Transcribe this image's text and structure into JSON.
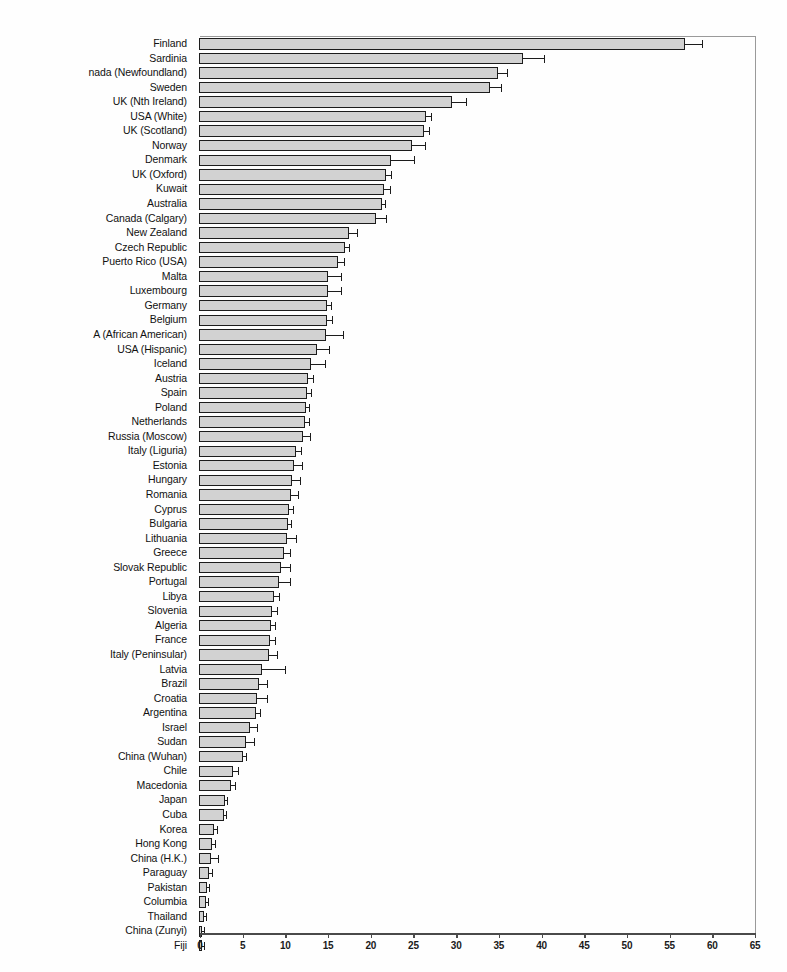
{
  "chart_data": {
    "type": "bar",
    "orientation": "horizontal",
    "title": "",
    "subtitle": "",
    "xlabel": "",
    "ylabel": "",
    "xlim": [
      0,
      65
    ],
    "xticks": [
      0,
      5,
      10,
      15,
      20,
      25,
      30,
      35,
      40,
      45,
      50,
      55,
      60,
      65
    ],
    "xtick_labels": [
      "0",
      "5",
      "10",
      "15",
      "20",
      "25",
      "30",
      "35",
      "40",
      "45",
      "50",
      "55",
      "60",
      "65"
    ],
    "grid": false,
    "legend": null,
    "error_bars": "upper only",
    "bar_fill_color": "#d2d2d2",
    "bar_edge_color": "#1c1c1c",
    "categories": [
      "Finland",
      "Sardinia",
      "nada (Newfoundland)",
      "Sweden",
      "UK (Nth Ireland)",
      "USA (White)",
      "UK (Scotland)",
      "Norway",
      "Denmark",
      "UK (Oxford)",
      "Kuwait",
      "Australia",
      "Canada (Calgary)",
      "New Zealand",
      "Czech Republic",
      "Puerto Rico (USA)",
      "Malta",
      "Luxembourg",
      "Germany",
      "Belgium",
      "A (African American)",
      "USA (Hispanic)",
      "Iceland",
      "Austria",
      "Spain",
      "Poland",
      "Netherlands",
      "Russia (Moscow)",
      "Italy (Liguria)",
      "Estonia",
      "Hungary",
      "Romania",
      "Cyprus",
      "Bulgaria",
      "Lithuania",
      "Greece",
      "Slovak Republic",
      "Portugal",
      "Libya",
      "Slovenia",
      "Algeria",
      "France",
      "Italy (Peninsular)",
      "Latvia",
      "Brazil",
      "Croatia",
      "Argentina",
      "Israel",
      "Sudan",
      "China (Wuhan)",
      "Chile",
      "Macedonia",
      "Japan",
      "Cuba",
      "Korea",
      "Hong Kong",
      "China (H.K.)",
      "Paraguay",
      "Pakistan",
      "Columbia",
      "Thailand",
      "China (Zunyi)",
      "Fiji"
    ],
    "values": [
      56.8,
      37.8,
      34.9,
      34.0,
      29.5,
      26.5,
      26.2,
      24.8,
      22.4,
      21.8,
      21.6,
      21.3,
      20.6,
      17.5,
      17.0,
      16.2,
      15.0,
      15.0,
      14.9,
      14.9,
      14.8,
      13.7,
      13.0,
      12.7,
      12.5,
      12.4,
      12.3,
      12.1,
      11.2,
      11.0,
      10.8,
      10.7,
      10.4,
      10.3,
      10.2,
      9.8,
      9.5,
      9.2,
      8.7,
      8.4,
      8.3,
      8.2,
      8.1,
      7.3,
      6.9,
      6.7,
      6.5,
      5.9,
      5.4,
      5.0,
      3.9,
      3.6,
      2.9,
      2.8,
      1.6,
      1.4,
      1.3,
      1.1,
      0.8,
      0.7,
      0.5,
      0.2,
      0.1
    ],
    "error_upper": [
      2.0,
      2.5,
      1.1,
      1.2,
      1.6,
      0.6,
      0.6,
      1.5,
      2.7,
      0.6,
      0.6,
      0.4,
      1.2,
      0.9,
      0.4,
      0.7,
      1.5,
      1.5,
      0.5,
      0.6,
      2.0,
      1.4,
      1.6,
      0.5,
      0.5,
      0.4,
      0.5,
      0.8,
      0.6,
      0.9,
      0.9,
      0.8,
      0.5,
      0.4,
      1.0,
      0.7,
      1.0,
      1.3,
      0.5,
      0.6,
      0.5,
      0.6,
      0.9,
      2.6,
      0.9,
      1.1,
      0.5,
      0.8,
      0.9,
      0.4,
      0.5,
      0.5,
      0.3,
      0.2,
      0.4,
      0.3,
      0.8,
      0.3,
      0.2,
      0.2,
      0.2,
      0.1,
      0.05
    ]
  },
  "axis": {
    "x_origin_px": 0,
    "x_span_px": 555
  }
}
